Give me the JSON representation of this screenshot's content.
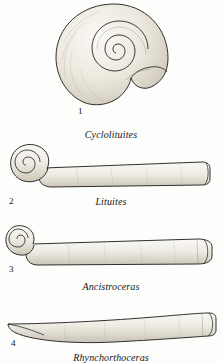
{
  "plate": {
    "kind": "scientific-illustration-plate",
    "subject": "fossil nautiloid cephalopod shells",
    "background_color": "#fdfdfb",
    "ink_color": "#1a1a1a",
    "fill_color": "#f2efe8",
    "width_px": 222,
    "height_px": 363
  },
  "figures": [
    {
      "number": "1",
      "caption": "Cyclolituites",
      "form": "tightly coiled planispiral shell with flared body chamber",
      "number_x": 78,
      "number_y": 107,
      "caption_y": 129
    },
    {
      "number": "2",
      "caption": "Lituites",
      "form": "coiled early whorls with long straight body chamber",
      "number_x": 9,
      "number_y": 197,
      "caption_y": 196
    },
    {
      "number": "3",
      "caption": "Ancistroceras",
      "form": "small coil with long tapering straight shell",
      "number_x": 9,
      "number_y": 265,
      "caption_y": 281
    },
    {
      "number": "4",
      "caption": "Rhynchorthoceras",
      "form": "slightly curved elongate orthoconic shell",
      "number_x": 11,
      "number_y": 339,
      "caption_y": 352
    }
  ]
}
